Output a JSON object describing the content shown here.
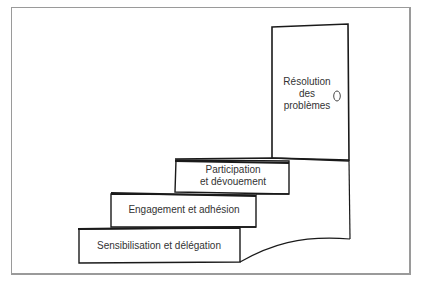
{
  "diagram": {
    "type": "staircase",
    "steps": [
      {
        "label": "Sensibilisation et délégation",
        "level": 1
      },
      {
        "label": "Engagement et adhésion",
        "level": 2
      },
      {
        "label_line1": "Participation",
        "label_line2": "et dévouement",
        "level": 3
      }
    ],
    "door": {
      "line1": "Résolution",
      "line2": "des",
      "line3": "problèmes",
      "knob_icon": "door-knob"
    }
  }
}
